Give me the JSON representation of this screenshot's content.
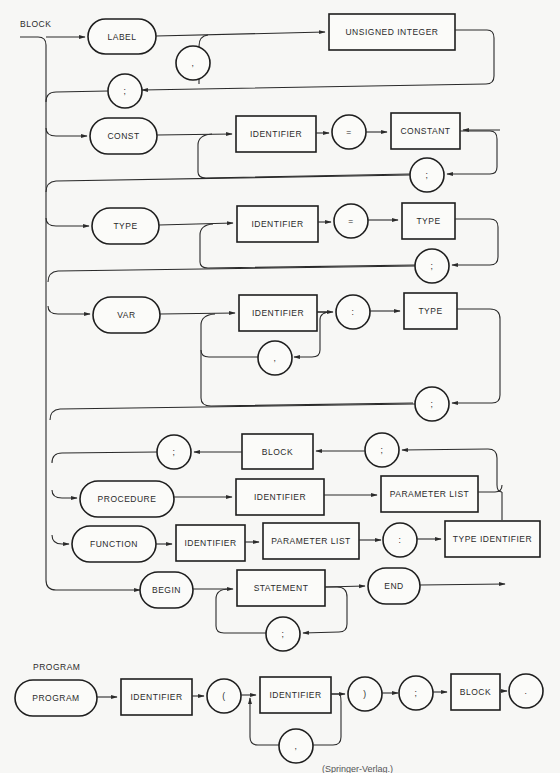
{
  "diagram": {
    "title_block": "BLOCK",
    "title_program": "PROGRAM",
    "caption": "(Springer-Verlag.)",
    "block": {
      "label_row": {
        "keyword": "LABEL",
        "item": "UNSIGNED INTEGER",
        "separator": ",",
        "terminator": ";"
      },
      "const_row": {
        "keyword": "CONST",
        "identifier": "IDENTIFIER",
        "equals": "=",
        "value": "CONSTANT",
        "terminator": ";"
      },
      "type_row": {
        "keyword": "TYPE",
        "identifier": "IDENTIFIER",
        "equals": "=",
        "value": "TYPE",
        "terminator": ";"
      },
      "var_row": {
        "keyword": "VAR",
        "identifier": "IDENTIFIER",
        "separator": ",",
        "colon": ":",
        "value": "TYPE",
        "terminator": ";"
      },
      "subprogram": {
        "block": "BLOCK",
        "semi_left": ";",
        "semi_right": ";"
      },
      "procedure_row": {
        "keyword": "PROCEDURE",
        "identifier": "IDENTIFIER",
        "params": "PARAMETER LIST"
      },
      "function_row": {
        "keyword": "FUNCTION",
        "identifier": "IDENTIFIER",
        "params": "PARAMETER LIST",
        "colon": ":",
        "result": "TYPE IDENTIFIER"
      },
      "begin_row": {
        "keyword": "BEGIN",
        "statement": "STATEMENT",
        "separator": ";",
        "end": "END"
      }
    },
    "program": {
      "keyword": "PROGRAM",
      "identifier": "IDENTIFIER",
      "open_paren": "(",
      "file_identifier": "IDENTIFIER",
      "separator": ",",
      "close_paren": ")",
      "semicolon": ";",
      "block": "BLOCK",
      "period": "."
    }
  }
}
